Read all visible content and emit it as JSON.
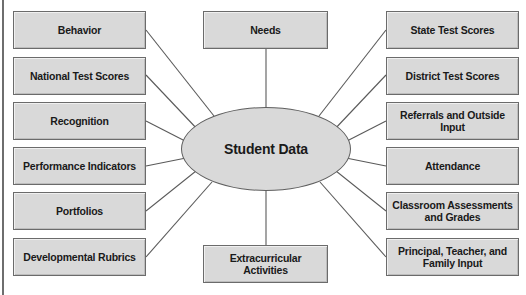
{
  "diagram": {
    "title": "Student Data",
    "center": {
      "label": "Student Data",
      "shape": "ellipse",
      "fill": "#d9d9d9",
      "stroke": "#5f5f5f"
    },
    "style": {
      "box_fill": "#d9d9d9",
      "box_stroke": "#6b6b6b",
      "connector_stroke": "#5a5a5a",
      "frame_stroke": "#6e6e6e",
      "text_color": "#1a1a1a",
      "background": "#ffffff"
    },
    "left_nodes": [
      {
        "label": "Behavior"
      },
      {
        "label": "National Test Scores"
      },
      {
        "label": "Recognition"
      },
      {
        "label": "Performance Indicators"
      },
      {
        "label": "Portfolios"
      },
      {
        "label": "Developmental Rubrics"
      }
    ],
    "right_nodes": [
      {
        "label": "State Test Scores"
      },
      {
        "label": "District Test Scores"
      },
      {
        "label": "Referrals and Outside Input"
      },
      {
        "label": "Attendance"
      },
      {
        "label": "Classroom Assessments and Grades"
      },
      {
        "label": "Principal, Teacher, and Family Input"
      }
    ],
    "top_node": {
      "label": "Needs"
    },
    "bottom_node": {
      "label": "Extracurricular Activities"
    }
  }
}
